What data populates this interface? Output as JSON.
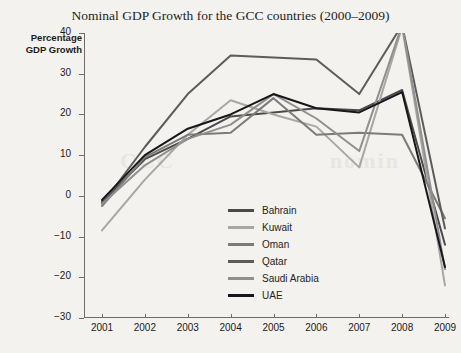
{
  "chart_data": {
    "type": "line",
    "title": "Nominal GDP Growth for the GCC countries (2000–2009)",
    "xlabel": "",
    "ylabel": "Percentage\nGDP Growth",
    "ylabel_line1": "Percentage",
    "ylabel_line2": "GDP Growth",
    "categories": [
      "2001",
      "2002",
      "2003",
      "2004",
      "2005",
      "2006",
      "2007",
      "2008",
      "2009"
    ],
    "x": [
      2001,
      2002,
      2003,
      2004,
      2005,
      2006,
      2007,
      2008,
      2009
    ],
    "xlim": [
      2001,
      2009
    ],
    "ylim": [
      -30,
      40
    ],
    "yticks": [
      40,
      30,
      20,
      10,
      0,
      -10,
      -20,
      -30
    ],
    "ytick_labels": [
      "40",
      "30",
      "20",
      "10",
      "0",
      "−10",
      "−20",
      "−30"
    ],
    "grid": false,
    "legend_position": "center",
    "series": [
      {
        "name": "Bahrain",
        "color": "#4c4a48",
        "values": [
          -1.5,
          9.0,
          14.0,
          19.5,
          20.5,
          21.5,
          21.0,
          26.0,
          -12.0
        ]
      },
      {
        "name": "Kuwait",
        "color": "#a9a7a4",
        "values": [
          -8.5,
          4.0,
          15.0,
          23.5,
          20.0,
          17.0,
          7.0,
          41.5,
          -22.0
        ]
      },
      {
        "name": "Oman",
        "color": "#7d7b78",
        "values": [
          -2.5,
          9.5,
          15.0,
          15.5,
          24.0,
          15.0,
          15.5,
          15.0,
          -5.5
        ]
      },
      {
        "name": "Qatar",
        "color": "#5e5c5a",
        "values": [
          -2.0,
          12.0,
          25.0,
          34.5,
          34.0,
          33.5,
          25.0,
          42.0,
          -8.0
        ]
      },
      {
        "name": "Saudi Arabia",
        "color": "#919090",
        "values": [
          -2.0,
          7.5,
          14.0,
          17.5,
          25.0,
          19.0,
          11.0,
          42.0,
          -18.0
        ]
      },
      {
        "name": "UAE",
        "color": "#17161a",
        "values": [
          -1.0,
          10.0,
          16.5,
          20.0,
          25.0,
          21.5,
          20.5,
          25.5,
          -17.5
        ]
      }
    ]
  },
  "legend": {
    "items": [
      {
        "label": "Bahrain"
      },
      {
        "label": "Kuwait"
      },
      {
        "label": "Oman"
      },
      {
        "label": "Qatar"
      },
      {
        "label": "Saudi Arabia"
      },
      {
        "label": "UAE"
      }
    ]
  },
  "watermarks": [
    {
      "text": "GCC",
      "left": 120,
      "top": 148
    },
    {
      "text": "nomin",
      "left": 330,
      "top": 148
    }
  ]
}
